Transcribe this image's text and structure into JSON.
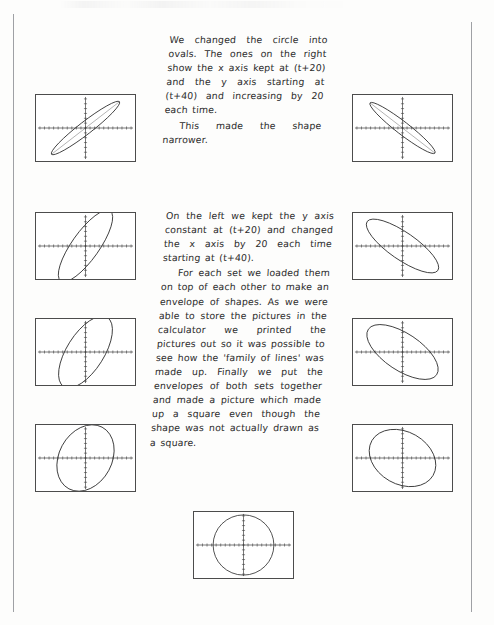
{
  "page": {
    "width": 494,
    "height": 625,
    "background": "#fdfdfc",
    "rule_color": "#8e9095",
    "ink_color": "#2b2b2b"
  },
  "text_blocks": [
    {
      "id": "para-1",
      "paragraphs": [
        "We changed the circle into ovals. The ones on the right show the x axis kept at (t+20) and the y axis starting at (t+40) and increasing by 20 each time.",
        "This made the shape narrower."
      ]
    },
    {
      "id": "para-2",
      "paragraphs": [
        "On the left we kept the y axis constant at (t+20) and changed the x axis by 20 each time starting at (t+40).",
        "For each set we loaded them on top of each other to make an envelope of shapes. As we were able to store the pictures in the calculator we printed the pictures out so it was possible to see how the 'family of lines' was made up. Finally we put the envelopes of both sets together and made a picture which made up a square even though the shape was not actually drawn as a square."
      ]
    }
  ],
  "calculator_screens": [
    {
      "id": "screen-1",
      "name": "narrow-oval-negative-slope",
      "position": "row1-left",
      "caption": "x axis (t+20), y axis (t+40) — narrow oval, negative slope",
      "x": 35,
      "y": 94,
      "w": 101,
      "h": 68,
      "shape": "ellipse",
      "rx": 44,
      "ry": 6.5,
      "rotation": -38
    },
    {
      "id": "screen-2",
      "name": "narrow-oval-positive-slope",
      "position": "row1-right",
      "caption": "x axis (t+20), y axis (t+40) — narrow oval, positive slope",
      "x": 352,
      "y": 94,
      "w": 101,
      "h": 68,
      "shape": "ellipse",
      "rx": 42,
      "ry": 6.5,
      "rotation": 38
    },
    {
      "id": "screen-3",
      "name": "medium-oval-negative-slope",
      "position": "row2-left",
      "caption": "y axis constant (t+20), x axis +20 — medium oval",
      "x": 35,
      "y": 212,
      "w": 101,
      "h": 68,
      "shape": "ellipse",
      "rx": 44,
      "ry": 14,
      "rotation": -55
    },
    {
      "id": "screen-4",
      "name": "medium-oval-positive-slope",
      "position": "row2-right",
      "caption": "x axis (t+20), y axis increasing — medium oval",
      "x": 352,
      "y": 212,
      "w": 101,
      "h": 68,
      "shape": "ellipse",
      "rx": 44,
      "ry": 14,
      "rotation": 35
    },
    {
      "id": "screen-5",
      "name": "wide-oval-negative-slope",
      "position": "row3-left",
      "caption": "wider oval, negative slope",
      "x": 35,
      "y": 318,
      "w": 101,
      "h": 68,
      "shape": "ellipse",
      "rx": 42,
      "ry": 19,
      "rotation": -58
    },
    {
      "id": "screen-6",
      "name": "wide-oval-positive-slope",
      "position": "row3-right",
      "caption": "wider oval, positive slope",
      "x": 352,
      "y": 318,
      "w": 101,
      "h": 68,
      "shape": "ellipse",
      "rx": 42,
      "ry": 19,
      "rotation": 34
    },
    {
      "id": "screen-7",
      "name": "near-circle-oval",
      "position": "row4-left",
      "caption": "almost circular oval",
      "x": 35,
      "y": 424,
      "w": 101,
      "h": 68,
      "shape": "ellipse",
      "rx": 36,
      "ry": 27,
      "rotation": -62
    },
    {
      "id": "screen-8",
      "name": "near-circle-oval-right",
      "position": "row4-right",
      "caption": "almost circular oval, positive slope",
      "x": 352,
      "y": 424,
      "w": 101,
      "h": 68,
      "shape": "ellipse",
      "rx": 36,
      "ry": 27,
      "rotation": 30
    },
    {
      "id": "screen-9",
      "name": "circle",
      "position": "row5-centre",
      "caption": "the original circle",
      "x": 193,
      "y": 511,
      "w": 101,
      "h": 68,
      "shape": "circle",
      "rx": 31,
      "ry": 31,
      "rotation": 0
    }
  ],
  "axis": {
    "tick_count_x": 20,
    "tick_count_y": 12,
    "axis_color": "#3a3a3a",
    "tick_color": "#3a3a3a",
    "x_axis_offset": 0,
    "y_axis_offset": 0
  }
}
